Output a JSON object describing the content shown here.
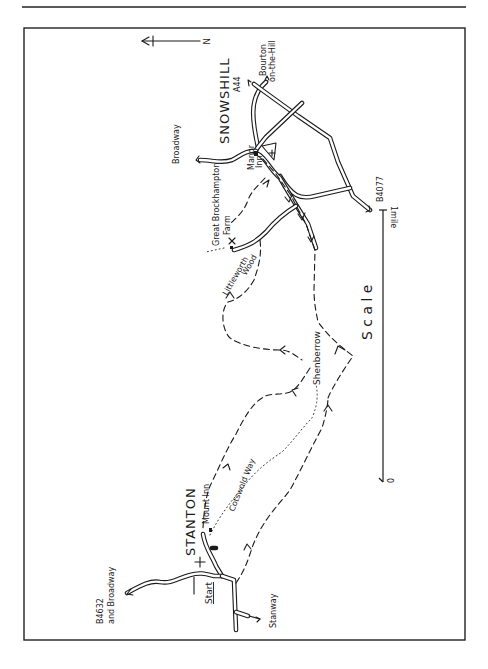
{
  "page": {
    "width": 488,
    "height": 669,
    "rule_y": 7,
    "frame": {
      "x": 24,
      "y": 28,
      "w": 441,
      "h": 612
    }
  },
  "colors": {
    "ink": "#1a1a1a",
    "paper": "#ffffff"
  },
  "north_arrow": {
    "label": "N",
    "x1": 142,
    "x2": 200,
    "y": 41
  },
  "places": {
    "snowshill": "SNOWSHILL",
    "stanton": "STANTON",
    "shenberrow": "Shenberrow",
    "littleworth_wood_1": "Littleworth",
    "littleworth_wood_2": "Wood",
    "great_brockhampton_1": "Great Brockhampton",
    "great_brockhampton_2": "Farm",
    "snowshill_inn_1": "Manor",
    "snowshill_inn_2": "Inn",
    "mount_inn": "Mount Inn",
    "cotswold_way": "Cotswold Way",
    "start": "Start"
  },
  "roads": {
    "a44": "A44",
    "bourton_1": "Bourton",
    "bourton_2": "on-the-Hill",
    "broadway": "Broadway",
    "b4077": "B4077",
    "b4632_1": "B4632",
    "b4632_2": "and Broadway",
    "stanway": "Stanway"
  },
  "scale": {
    "title": "S c a l e",
    "label_max": "1mile",
    "label_min": "0",
    "x": 383,
    "y_top": 210,
    "y_bottom": 483
  },
  "legend_symbols": {
    "route": "dashed line with arrows",
    "footpath": "dotted line",
    "church": "+"
  }
}
